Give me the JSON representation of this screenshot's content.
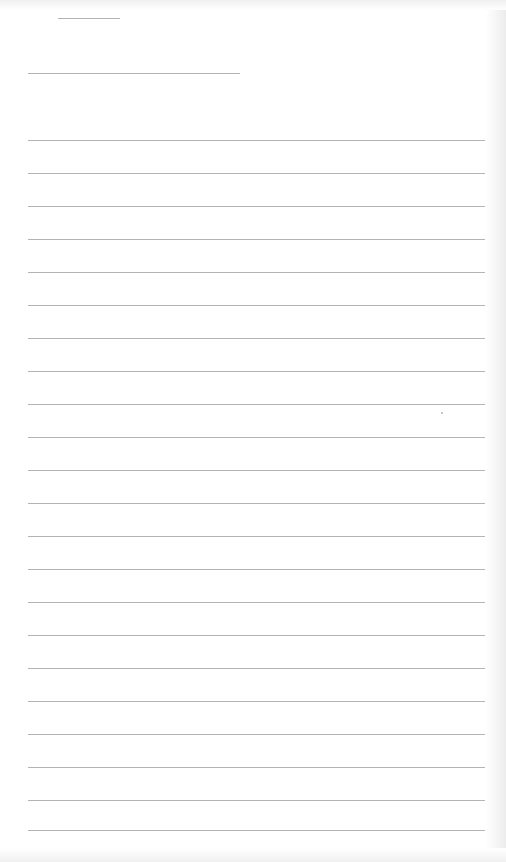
{
  "page": {
    "type": "blank-lined-paper",
    "background_color": "#ffffff",
    "rule_color": "#9a9a9a"
  },
  "header": {
    "short_line": {
      "x": 58,
      "y": 18,
      "width": 62
    },
    "medium_line": {
      "x": 28,
      "y": 73,
      "width": 212
    }
  },
  "lines": {
    "x": 28,
    "width": 457,
    "y_positions": [
      140,
      173,
      206,
      239,
      272,
      305,
      338,
      371,
      404,
      437,
      470,
      503,
      536,
      569,
      602,
      635,
      668,
      701,
      734,
      767,
      800,
      830
    ]
  },
  "text": {
    "title": "",
    "name_field": ""
  }
}
